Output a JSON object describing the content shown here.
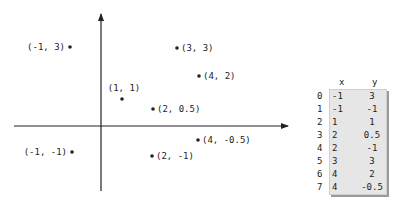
{
  "diagram": {
    "x_axis": {
      "from": [
        14,
        126
      ],
      "to": [
        288,
        126
      ]
    },
    "y_axis": {
      "from": [
        101,
        191
      ],
      "to": [
        101,
        14
      ]
    },
    "points": [
      {
        "label": "(-1, 3)",
        "x": -1,
        "y": 3,
        "px": 70,
        "py": 47,
        "label_side": "left"
      },
      {
        "label": "(3, 3)",
        "x": 3,
        "y": 3,
        "px": 177,
        "py": 48,
        "label_side": "right"
      },
      {
        "label": "(4, 2)",
        "x": 4,
        "y": 2,
        "px": 199,
        "py": 76,
        "label_side": "right"
      },
      {
        "label": "(1, 1)",
        "x": 1,
        "y": 1,
        "px": 122,
        "py": 99,
        "label_side": "above"
      },
      {
        "label": "(2, 0.5)",
        "x": 2,
        "y": 0.5,
        "px": 153,
        "py": 109,
        "label_side": "right"
      },
      {
        "label": "(4, -0.5)",
        "x": 4,
        "y": -0.5,
        "px": 198,
        "py": 140,
        "label_side": "right"
      },
      {
        "label": "(-1, -1)",
        "x": -1,
        "y": -1,
        "px": 72,
        "py": 152,
        "label_side": "left"
      },
      {
        "label": "(2, -1)",
        "x": 2,
        "y": -1,
        "px": 152,
        "py": 156,
        "label_side": "right"
      }
    ]
  },
  "table": {
    "columns": [
      "x",
      "y"
    ],
    "rows": [
      {
        "index": "0",
        "x": "-1",
        "y": "3"
      },
      {
        "index": "1",
        "x": "-1",
        "y": "-1"
      },
      {
        "index": "2",
        "x": "1",
        "y": "1"
      },
      {
        "index": "3",
        "x": "2",
        "y": "0.5"
      },
      {
        "index": "4",
        "x": "2",
        "y": "-1"
      },
      {
        "index": "5",
        "x": "3",
        "y": "3"
      },
      {
        "index": "6",
        "x": "4",
        "y": "2"
      },
      {
        "index": "7",
        "x": "4",
        "y": "-0.5"
      }
    ]
  },
  "colors": {
    "ink": "#222222",
    "table_bg": "#e6e6e6",
    "table_shadow": "#9a9a9a"
  }
}
